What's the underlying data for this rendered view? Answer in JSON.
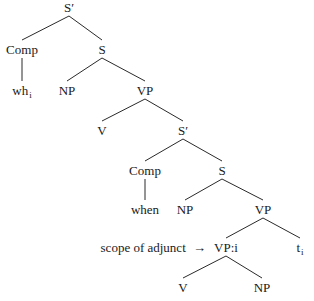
{
  "diagram": {
    "type": "syntax-tree",
    "nodes": [
      {
        "id": "sbar1",
        "label": "S′"
      },
      {
        "id": "comp1",
        "label": "Comp"
      },
      {
        "id": "wh",
        "label": "wh",
        "subscript": "i"
      },
      {
        "id": "s1",
        "label": "S"
      },
      {
        "id": "np1",
        "label": "NP"
      },
      {
        "id": "vp1",
        "label": "VP"
      },
      {
        "id": "v1",
        "label": "V"
      },
      {
        "id": "sbar2",
        "label": "S′"
      },
      {
        "id": "comp2",
        "label": "Comp"
      },
      {
        "id": "when",
        "label": "when"
      },
      {
        "id": "s2",
        "label": "S"
      },
      {
        "id": "np2",
        "label": "NP"
      },
      {
        "id": "vp2",
        "label": "VP"
      },
      {
        "id": "vpi",
        "label": "VP:i"
      },
      {
        "id": "trace",
        "label": "t",
        "subscript": "i"
      },
      {
        "id": "v2",
        "label": "V"
      },
      {
        "id": "np3",
        "label": "NP"
      }
    ],
    "edges": [
      [
        "sbar1",
        "comp1"
      ],
      [
        "sbar1",
        "s1"
      ],
      [
        "comp1",
        "wh"
      ],
      [
        "s1",
        "np1"
      ],
      [
        "s1",
        "vp1"
      ],
      [
        "vp1",
        "v1"
      ],
      [
        "vp1",
        "sbar2"
      ],
      [
        "sbar2",
        "comp2"
      ],
      [
        "sbar2",
        "s2"
      ],
      [
        "comp2",
        "when"
      ],
      [
        "s2",
        "np2"
      ],
      [
        "s2",
        "vp2"
      ],
      [
        "vp2",
        "vpi"
      ],
      [
        "vp2",
        "trace"
      ],
      [
        "vpi",
        "v2"
      ],
      [
        "vpi",
        "np3"
      ]
    ],
    "annotation": {
      "text": "scope of adjunct",
      "arrow": "→",
      "points_to": "vpi"
    }
  }
}
